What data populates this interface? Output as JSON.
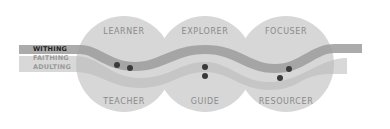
{
  "diagram": {
    "circles_top": [
      {
        "label": "LEARNER"
      },
      {
        "label": "EXPLORER"
      },
      {
        "label": "FOCUSER"
      }
    ],
    "circles_bottom": [
      {
        "label": "TEACHER"
      },
      {
        "label": "GUIDE"
      },
      {
        "label": "RESOURCER"
      }
    ],
    "legend": [
      {
        "label": "WITHING",
        "active": true
      },
      {
        "label": "FAITHING",
        "active": false
      },
      {
        "label": "ADULTING",
        "active": false
      }
    ],
    "colors": {
      "circle": "#cfcfcf",
      "overlap": "#bdbdbd",
      "band_dark": "#9e9e9e",
      "band_light": "#c4c4c4",
      "dot": "#3a3a3a",
      "text": "#8a8a8a"
    }
  }
}
